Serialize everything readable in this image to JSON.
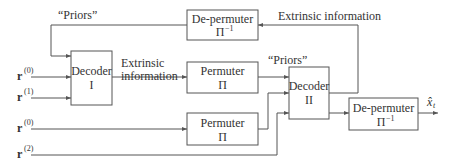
{
  "blocks": {
    "decoder1": {
      "line1": "Decoder",
      "line2": "I"
    },
    "decoder2": {
      "line1": "Decoder",
      "line2": "II"
    },
    "depermuter_top": {
      "line1": "De-permuter",
      "line2": "Π",
      "sup": "−1"
    },
    "permuter_top": {
      "line1": "Permuter",
      "line2": "Π"
    },
    "permuter_bottom": {
      "line1": "Permuter",
      "line2": "Π"
    },
    "depermuter_out": {
      "line1": "De-permuter",
      "line2": "Π",
      "sup": "−1"
    }
  },
  "labels": {
    "priors_top": "“Priors”",
    "priors_mid": "“Priors”",
    "extrinsic_mid_1": "Extrinsic",
    "extrinsic_mid_2": "information",
    "extrinsic_top": "Extrinsic information"
  },
  "inputs": [
    {
      "base": "r",
      "sup": "(0)"
    },
    {
      "base": "r",
      "sup": "(1)"
    },
    {
      "base": "r",
      "sup": "(0)"
    },
    {
      "base": "r",
      "sup": "(2)"
    }
  ],
  "output": {
    "base": "x̂",
    "sub": "t"
  }
}
